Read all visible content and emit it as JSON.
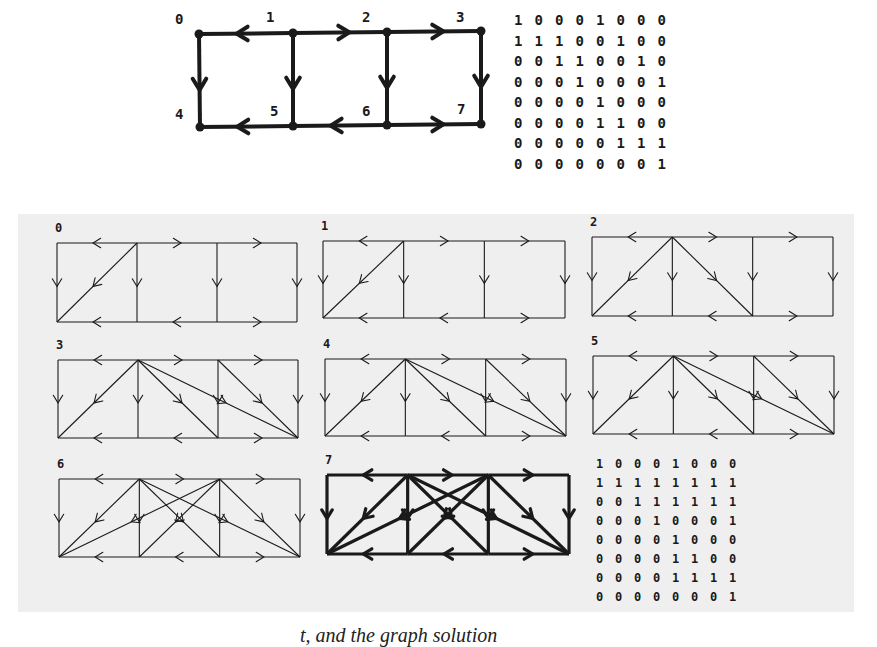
{
  "top_graph": {
    "title": "Directed graph G",
    "nodes": [
      {
        "id": "0",
        "x": 199,
        "y": 34,
        "lx": 175,
        "ly": 24
      },
      {
        "id": "1",
        "x": 293,
        "y": 33,
        "lx": 266,
        "ly": 22
      },
      {
        "id": "2",
        "x": 387,
        "y": 32,
        "lx": 362,
        "ly": 22
      },
      {
        "id": "3",
        "x": 481,
        "y": 31,
        "lx": 456,
        "ly": 22
      },
      {
        "id": "4",
        "x": 200,
        "y": 127,
        "lx": 175,
        "ly": 119
      },
      {
        "id": "5",
        "x": 293,
        "y": 126,
        "lx": 270,
        "ly": 116
      },
      {
        "id": "6",
        "x": 387,
        "y": 125,
        "lx": 362,
        "ly": 116
      },
      {
        "id": "7",
        "x": 481,
        "y": 124,
        "lx": 457,
        "ly": 114
      }
    ],
    "edges": [
      [
        "1",
        "0"
      ],
      [
        "1",
        "2"
      ],
      [
        "2",
        "3"
      ],
      [
        "0",
        "4"
      ],
      [
        "1",
        "5"
      ],
      [
        "2",
        "6"
      ],
      [
        "3",
        "7"
      ],
      [
        "5",
        "4"
      ],
      [
        "6",
        "5"
      ],
      [
        "6",
        "7"
      ]
    ]
  },
  "top_matrix": {
    "label": "Adjacency matrix (reflexive)",
    "rows": [
      [
        "1",
        "0",
        "0",
        "0",
        "1",
        "0",
        "0",
        "0"
      ],
      [
        "1",
        "1",
        "1",
        "0",
        "0",
        "1",
        "0",
        "0"
      ],
      [
        "0",
        "0",
        "1",
        "1",
        "0",
        "0",
        "1",
        "0"
      ],
      [
        "0",
        "0",
        "0",
        "1",
        "0",
        "0",
        "0",
        "1"
      ],
      [
        "0",
        "0",
        "0",
        "0",
        "1",
        "0",
        "0",
        "0"
      ],
      [
        "0",
        "0",
        "0",
        "0",
        "1",
        "1",
        "0",
        "0"
      ],
      [
        "0",
        "0",
        "0",
        "0",
        "0",
        "1",
        "1",
        "1"
      ],
      [
        "0",
        "0",
        "0",
        "0",
        "0",
        "0",
        "0",
        "1"
      ]
    ]
  },
  "panels": [
    {
      "label": "0",
      "x": 57,
      "y": 243,
      "w": 240,
      "h": 79,
      "bold": false,
      "extra_edges": [
        [
          "1",
          "4"
        ]
      ]
    },
    {
      "label": "1",
      "x": 323,
      "y": 241,
      "w": 242,
      "h": 77,
      "bold": false,
      "extra_edges": [
        [
          "1",
          "4"
        ]
      ]
    },
    {
      "label": "2",
      "x": 592,
      "y": 237,
      "w": 241,
      "h": 79,
      "bold": false,
      "extra_edges": [
        [
          "1",
          "4"
        ],
        [
          "1",
          "6"
        ]
      ]
    },
    {
      "label": "3",
      "x": 58,
      "y": 360,
      "w": 240,
      "h": 78,
      "bold": false,
      "extra_edges": [
        [
          "1",
          "4"
        ],
        [
          "1",
          "6"
        ],
        [
          "1",
          "7"
        ],
        [
          "2",
          "7"
        ]
      ]
    },
    {
      "label": "4",
      "x": 325,
      "y": 359,
      "w": 241,
      "h": 77,
      "bold": false,
      "extra_edges": [
        [
          "1",
          "4"
        ],
        [
          "1",
          "6"
        ],
        [
          "1",
          "7"
        ],
        [
          "2",
          "7"
        ]
      ]
    },
    {
      "label": "5",
      "x": 593,
      "y": 356,
      "w": 241,
      "h": 78,
      "bold": false,
      "extra_edges": [
        [
          "1",
          "4"
        ],
        [
          "1",
          "6"
        ],
        [
          "1",
          "7"
        ],
        [
          "2",
          "7"
        ]
      ]
    },
    {
      "label": "6",
      "x": 59,
      "y": 479,
      "w": 241,
      "h": 78,
      "bold": false,
      "extra_edges": [
        [
          "1",
          "4"
        ],
        [
          "1",
          "6"
        ],
        [
          "1",
          "7"
        ],
        [
          "2",
          "7"
        ],
        [
          "2",
          "4"
        ],
        [
          "2",
          "5"
        ]
      ]
    },
    {
      "label": "7",
      "x": 327,
      "y": 475,
      "w": 242,
      "h": 79,
      "bold": true,
      "extra_edges": [
        [
          "1",
          "4"
        ],
        [
          "1",
          "6"
        ],
        [
          "1",
          "7"
        ],
        [
          "2",
          "7"
        ],
        [
          "2",
          "4"
        ],
        [
          "2",
          "5"
        ]
      ]
    }
  ],
  "bottom_matrix": {
    "label": "Transitive closure matrix",
    "rows": [
      [
        "1",
        "0",
        "0",
        "0",
        "1",
        "0",
        "0",
        "0"
      ],
      [
        "1",
        "1",
        "1",
        "1",
        "1",
        "1",
        "1",
        "1"
      ],
      [
        "0",
        "0",
        "1",
        "1",
        "1",
        "1",
        "1",
        "1"
      ],
      [
        "0",
        "0",
        "0",
        "1",
        "0",
        "0",
        "0",
        "1"
      ],
      [
        "0",
        "0",
        "0",
        "0",
        "1",
        "0",
        "0",
        "0"
      ],
      [
        "0",
        "0",
        "0",
        "0",
        "1",
        "1",
        "0",
        "0"
      ],
      [
        "0",
        "0",
        "0",
        "0",
        "1",
        "1",
        "1",
        "1"
      ],
      [
        "0",
        "0",
        "0",
        "0",
        "0",
        "0",
        "0",
        "1"
      ]
    ]
  },
  "caption": {
    "text": "t, and the graph solution"
  },
  "colors": {
    "ink": "#1a1a1a",
    "band": "#efefef",
    "paper": "#ffffff"
  }
}
